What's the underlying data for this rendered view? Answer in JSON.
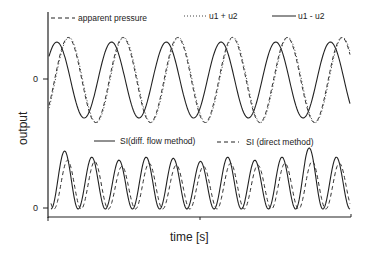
{
  "chart_data": [
    {
      "type": "line",
      "panel": "top",
      "title": "",
      "xlabel": "time [s]",
      "ylabel": "output",
      "yticks": [
        "0"
      ],
      "xlim": [
        0,
        5.5
      ],
      "ylim": [
        -1.2,
        1.2
      ],
      "legend": [
        {
          "name": "apparent pressure",
          "style": "dashed"
        },
        {
          "name": "u1 + u2",
          "style": "dotted"
        },
        {
          "name": "u1 -  u2",
          "style": "solid"
        }
      ],
      "legend_placement": "top",
      "series": [
        {
          "name": "u1 -  u2",
          "style": "solid",
          "amplitude": 1.0,
          "period_cycles": 5.5,
          "phase_deg": 180,
          "note": "sinusoid, starts near trough"
        },
        {
          "name": "apparent pressure",
          "style": "dashed",
          "amplitude": 1.12,
          "period_cycles": 5.5,
          "phase_lag_deg": 75
        },
        {
          "name": "u1 + u2",
          "style": "dotted",
          "amplitude": 1.12,
          "period_cycles": 5.5,
          "phase_lag_deg": 80
        }
      ]
    },
    {
      "type": "line",
      "panel": "bottom",
      "title": "",
      "xlabel": "time [s]",
      "ylabel": "output",
      "yticks": [
        "0"
      ],
      "xlim": [
        0,
        11
      ],
      "ylim": [
        0,
        1.0
      ],
      "legend": [
        {
          "name": "SI(diff. flow method)",
          "style": "solid"
        },
        {
          "name": "SI (direct method)",
          "style": "dashed"
        }
      ],
      "legend_placement": "top",
      "series": [
        {
          "name": "SI(diff. flow method)",
          "style": "solid",
          "peaks": [
            0.95,
            0.85,
            0.8,
            0.85,
            0.83,
            0.78,
            0.85,
            0.8,
            0.85,
            1.0,
            0.85
          ]
        },
        {
          "name": "SI (direct method)",
          "style": "dashed",
          "peaks": [
            0.8,
            0.78,
            0.7,
            0.75,
            0.72,
            0.7,
            0.75,
            0.72,
            0.75,
            0.78,
            0.75
          ]
        }
      ]
    }
  ],
  "labels": {
    "top_legend": [
      "apparent pressure",
      "u1 + u2",
      "u1 -  u2"
    ],
    "bottom_legend": [
      "SI(diff. flow method)",
      "SI (direct method)"
    ],
    "xlabel": "time [s]",
    "ylabel": "output",
    "zero_top": "0",
    "zero_bottom": "0"
  }
}
